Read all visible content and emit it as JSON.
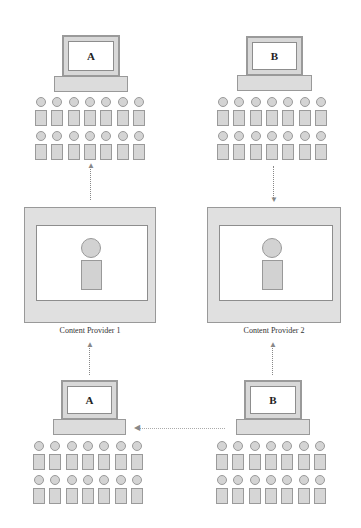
{
  "diagram": {
    "type": "content-distribution-network",
    "top_groups": [
      {
        "id": "top-left",
        "laptop_label": "A",
        "people_rows": 2,
        "people_per_row": 7
      },
      {
        "id": "top-right",
        "laptop_label": "B",
        "people_rows": 2,
        "people_per_row": 7
      }
    ],
    "providers": [
      {
        "id": "provider-1",
        "label": "Content Provider 1"
      },
      {
        "id": "provider-2",
        "label": "Content Provider 2"
      }
    ],
    "bottom_groups": [
      {
        "id": "bottom-left",
        "laptop_label": "A",
        "people_rows": 2,
        "people_per_row": 7
      },
      {
        "id": "bottom-right",
        "laptop_label": "B",
        "people_rows": 2,
        "people_per_row": 7
      }
    ],
    "connections": [
      {
        "from": "provider-1",
        "to": "top-left",
        "direction": "up"
      },
      {
        "from": "top-right",
        "to": "provider-2",
        "direction": "down"
      },
      {
        "from": "bottom-left",
        "to": "provider-1",
        "direction": "up"
      },
      {
        "from": "bottom-right",
        "to": "provider-2",
        "direction": "up"
      },
      {
        "from": "bottom-right",
        "to": "bottom-left",
        "direction": "left"
      }
    ],
    "colors": {
      "stroke": "#999999",
      "fill": "#d8d8d8",
      "background": "#ffffff"
    }
  },
  "labels": {
    "top_left_laptop": "A",
    "top_right_laptop": "B",
    "provider_1": "Content Provider 1",
    "provider_2": "Content Provider 2",
    "bottom_left_laptop": "A",
    "bottom_right_laptop": "B"
  }
}
